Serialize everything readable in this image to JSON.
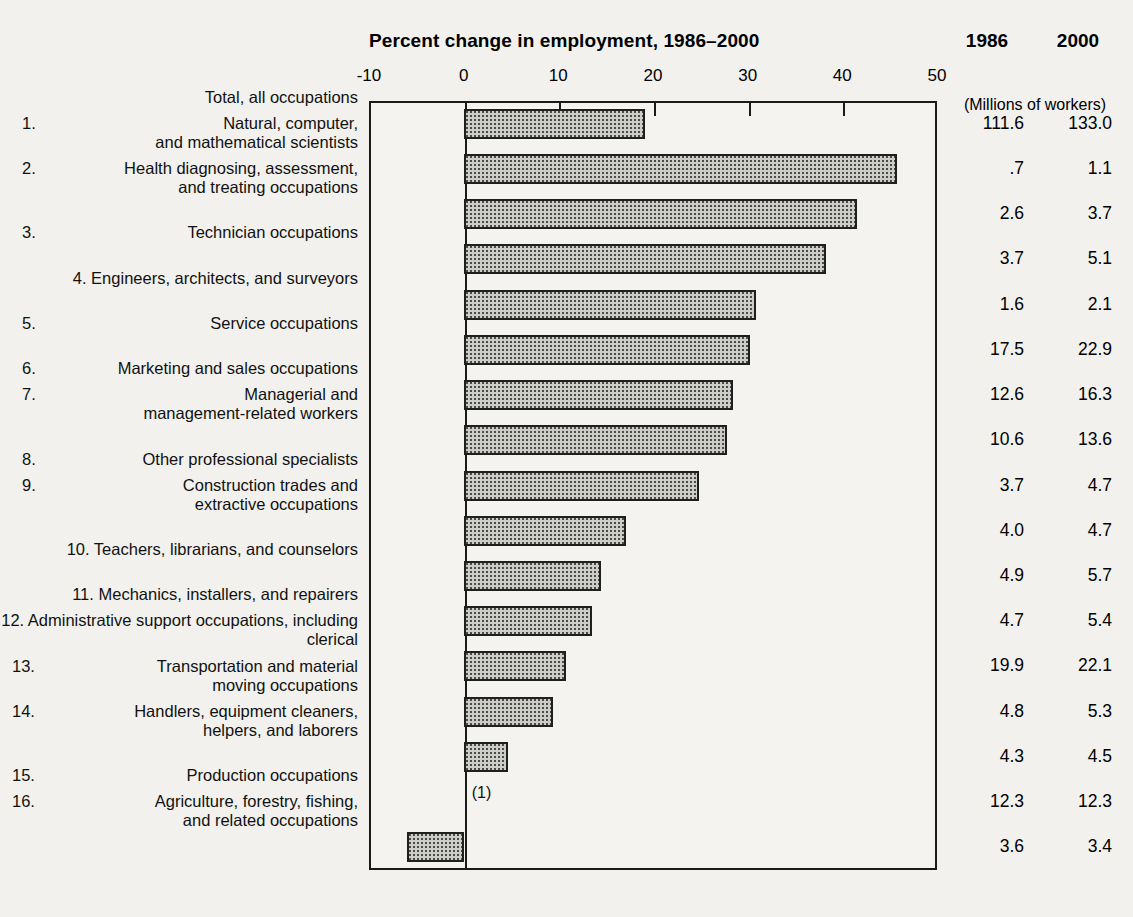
{
  "chart_data": {
    "type": "bar",
    "orientation": "horizontal",
    "title": "Percent change in employment, 1986–2000",
    "xlabel": "",
    "ylabel": "",
    "xlim": [
      -10,
      50
    ],
    "xticks": [
      -10,
      0,
      10,
      20,
      30,
      40,
      50
    ],
    "xtick_labels": [
      "-10",
      "0",
      "10",
      "20",
      "30",
      "40",
      "50"
    ],
    "grid": false,
    "legend": null,
    "categories": [
      "Total, all occupations",
      "Natural, computer, and mathematical scientists",
      "Health diagnosing, assessment, and treating occupations",
      "Technician occupations",
      "Engineers, architects, and surveyors",
      "Service occupations",
      "Marketing and sales occupations",
      "Managerial and management-related workers",
      "Other professional specialists",
      "Construction trades and extractive occupations",
      "Teachers, librarians, and counselors",
      "Mechanics, installers, and repairers",
      "Administrative support occupations, including clerical",
      "Transportation and material moving occupations",
      "Handlers, equipment cleaners, helpers, and laborers",
      "Production occupations",
      "Agriculture, forestry, fishing, and related occupations"
    ],
    "values": [
      19.2,
      45.8,
      41.6,
      38.3,
      30.9,
      30.2,
      28.5,
      27.8,
      24.9,
      17.1,
      14.5,
      13.6,
      10.8,
      9.4,
      4.7,
      0.0,
      -6.0
    ],
    "annotations": [
      {
        "row": 15,
        "text": "(1)"
      }
    ]
  },
  "header": {
    "col_1986": "1986",
    "col_2000": "2000",
    "units_note": "(Millions of workers)"
  },
  "rows": [
    {
      "num": "",
      "label_lines": [
        "Total, all occupations"
      ],
      "v1986": "111.6",
      "v2000": "133.0",
      "pct": 19.2,
      "note": ""
    },
    {
      "num": "1.",
      "label_lines": [
        "Natural, computer,",
        "and mathematical scientists"
      ],
      "v1986": ".7",
      "v2000": "1.1",
      "pct": 45.8,
      "note": ""
    },
    {
      "num": "2.",
      "label_lines": [
        "Health diagnosing, assessment,",
        "and treating occupations"
      ],
      "v1986": "2.6",
      "v2000": "3.7",
      "pct": 41.6,
      "note": ""
    },
    {
      "num": "3.",
      "label_lines": [
        "Technician occupations"
      ],
      "v1986": "3.7",
      "v2000": "5.1",
      "pct": 38.3,
      "note": ""
    },
    {
      "num": "4.",
      "label_lines": [
        "Engineers, architects, and surveyors"
      ],
      "v1986": "1.6",
      "v2000": "2.1",
      "pct": 30.9,
      "note": "",
      "inline": true
    },
    {
      "num": "5.",
      "label_lines": [
        "Service occupations"
      ],
      "v1986": "17.5",
      "v2000": "22.9",
      "pct": 30.2,
      "note": ""
    },
    {
      "num": "6.",
      "label_lines": [
        "Marketing and sales occupations"
      ],
      "v1986": "12.6",
      "v2000": "16.3",
      "pct": 28.5,
      "note": ""
    },
    {
      "num": "7.",
      "label_lines": [
        "Managerial and",
        "management-related workers"
      ],
      "v1986": "10.6",
      "v2000": "13.6",
      "pct": 27.8,
      "note": ""
    },
    {
      "num": "8.",
      "label_lines": [
        "Other professional specialists"
      ],
      "v1986": "3.7",
      "v2000": "4.7",
      "pct": 24.9,
      "note": ""
    },
    {
      "num": "9.",
      "label_lines": [
        "Construction trades and",
        "extractive occupations"
      ],
      "v1986": "4.0",
      "v2000": "4.7",
      "pct": 17.1,
      "note": ""
    },
    {
      "num": "10.",
      "label_lines": [
        "Teachers, librarians, and counselors"
      ],
      "v1986": "4.9",
      "v2000": "5.7",
      "pct": 14.5,
      "note": "",
      "inline": true
    },
    {
      "num": "11.",
      "label_lines": [
        "Mechanics, installers, and repairers"
      ],
      "v1986": "4.7",
      "v2000": "5.4",
      "pct": 13.6,
      "note": "",
      "inline": true
    },
    {
      "num": "12.",
      "label_lines": [
        "Administrative support occupations,",
        "including clerical"
      ],
      "v1986": "19.9",
      "v2000": "22.1",
      "pct": 10.8,
      "note": "",
      "inline": true
    },
    {
      "num": "13.",
      "label_lines": [
        "Transportation and material",
        "moving occupations"
      ],
      "v1986": "4.8",
      "v2000": "5.3",
      "pct": 9.4,
      "note": ""
    },
    {
      "num": "14.",
      "label_lines": [
        "Handlers, equipment cleaners,",
        "helpers, and laborers"
      ],
      "v1986": "4.3",
      "v2000": "4.5",
      "pct": 4.7,
      "note": ""
    },
    {
      "num": "15.",
      "label_lines": [
        "Production occupations"
      ],
      "v1986": "12.3",
      "v2000": "12.3",
      "pct": 0.0,
      "note": "(1)"
    },
    {
      "num": "16.",
      "label_lines": [
        "Agriculture, forestry, fishing,",
        "and related occupations"
      ],
      "v1986": "3.6",
      "v2000": "3.4",
      "pct": -6.0,
      "note": ""
    }
  ],
  "colors": {
    "background": "#f2f1ee",
    "plot_background": "#f4f3f0",
    "bar_fill": "#cdcdc8",
    "bar_stipple": "#4a4a4a",
    "bar_border": "#1f1f1f",
    "frame": "#1a1a1a",
    "text": "#111111"
  }
}
